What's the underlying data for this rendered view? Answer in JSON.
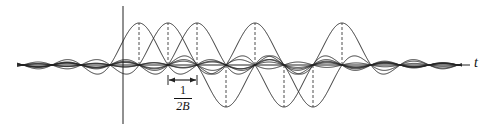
{
  "diagram": {
    "axis": {
      "horizontal_label": "t"
    },
    "spacing_label": {
      "numerator": "1",
      "denominator": "2B"
    },
    "colors": {
      "stroke": "#222222",
      "background": "#ffffff"
    },
    "pulses": [
      {
        "center_x": 139,
        "sign": 1
      },
      {
        "center_x": 168,
        "sign": 1
      },
      {
        "center_x": 197,
        "sign": 1
      },
      {
        "center_x": 226,
        "sign": -1
      },
      {
        "center_x": 255,
        "sign": 1
      },
      {
        "center_x": 284,
        "sign": -1
      },
      {
        "center_x": 313,
        "sign": -1
      },
      {
        "center_x": 342,
        "sign": 1
      }
    ],
    "pulse_spacing_px": 29,
    "baseline_y": 65,
    "amplitude_px": 42
  }
}
